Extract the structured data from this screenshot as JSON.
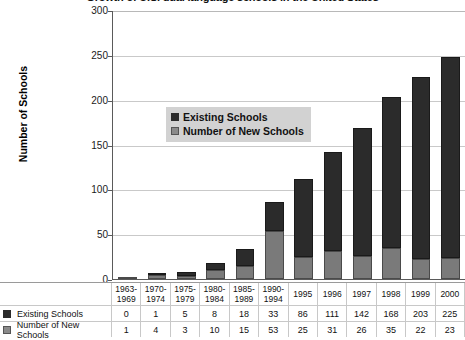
{
  "title": "Growth of U.S. dual language schools in the United States",
  "chart_data": {
    "type": "bar",
    "stacked": true,
    "title": "Growth of U.S. dual language schools in the United States",
    "xlabel": "",
    "ylabel": "Number of Schools",
    "ylim": [
      0,
      300
    ],
    "yticks": [
      0,
      50,
      100,
      150,
      200,
      250,
      300
    ],
    "grid": true,
    "legend_position": "inside-upper-left",
    "categories": [
      "1963-1969",
      "1970-1974",
      "1975-1979",
      "1980-1984",
      "1985-1989",
      "1990-1994",
      "1995",
      "1996",
      "1997",
      "1998",
      "1999",
      "2000"
    ],
    "series": [
      {
        "name": "Existing Schools",
        "color": "#2b2b2b",
        "values": [
          0,
          1,
          5,
          8,
          18,
          33,
          86,
          111,
          142,
          168,
          203,
          225
        ]
      },
      {
        "name": "Number of New Schools",
        "color": "#7a7a7a",
        "values": [
          1,
          4,
          3,
          10,
          15,
          53,
          25,
          31,
          26,
          35,
          22,
          23
        ]
      }
    ],
    "totals": [
      1,
      5,
      8,
      18,
      33,
      86,
      111,
      142,
      168,
      203,
      225,
      248
    ]
  },
  "axis": {
    "y_title": "Number of Schools",
    "y_ticks": [
      "300",
      "250",
      "200",
      "150",
      "100",
      "50",
      "0"
    ],
    "x_labels": [
      [
        "1963-",
        "1969"
      ],
      [
        "1970-",
        "1974"
      ],
      [
        "1975-",
        "1979"
      ],
      [
        "1980-",
        "1984"
      ],
      [
        "1985-",
        "1989"
      ],
      [
        "1990-",
        "1994"
      ],
      [
        "1995",
        ""
      ],
      [
        "1996",
        ""
      ],
      [
        "1997",
        ""
      ],
      [
        "1998",
        ""
      ],
      [
        "1999",
        ""
      ],
      [
        "2000",
        ""
      ]
    ]
  },
  "legend": {
    "items": [
      {
        "label": "Existing Schools",
        "swatch": "dark"
      },
      {
        "label": "Number of New Schools",
        "swatch": "gray"
      }
    ]
  },
  "table": {
    "header": [
      [
        "1963-",
        "1969"
      ],
      [
        "1970-",
        "1974"
      ],
      [
        "1975-",
        "1979"
      ],
      [
        "1980-",
        "1984"
      ],
      [
        "1985-",
        "1989"
      ],
      [
        "1990-",
        "1994"
      ],
      [
        "1995",
        ""
      ],
      [
        "1996",
        ""
      ],
      [
        "1997",
        ""
      ],
      [
        "1998",
        ""
      ],
      [
        "1999",
        ""
      ],
      [
        "2000",
        ""
      ]
    ],
    "rows": [
      {
        "label": "Existing Schools",
        "swatch": "dark",
        "values": [
          "0",
          "1",
          "5",
          "8",
          "18",
          "33",
          "86",
          "111",
          "142",
          "168",
          "203",
          "225"
        ]
      },
      {
        "label": "Number of New Schools",
        "swatch": "gray",
        "values": [
          "1",
          "4",
          "3",
          "10",
          "15",
          "53",
          "25",
          "31",
          "26",
          "35",
          "22",
          "23"
        ]
      }
    ]
  },
  "colors": {
    "existing": "#2b2b2b",
    "new": "#7a7a7a",
    "grid": "#c9c9c9",
    "axis": "#5a5a5a",
    "legend_bg": "#d2d2d2"
  }
}
